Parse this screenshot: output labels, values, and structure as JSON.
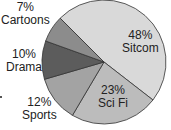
{
  "chart_data": {
    "type": "pie",
    "title": "",
    "categories": [
      "Sitcom",
      "Sci Fi",
      "Sports",
      "Drama",
      "Cartoons"
    ],
    "values": [
      48,
      23,
      12,
      10,
      7
    ],
    "unit": "%",
    "colors": [
      "#d9d9d9",
      "#bcbcbc",
      "#a3a3a3",
      "#5c5c5c",
      "#8c8c8c"
    ],
    "labels": [
      {
        "pct": "48%",
        "name": "Sitcom"
      },
      {
        "pct": "23%",
        "name": "Sci Fi"
      },
      {
        "pct": "12%",
        "name": "Sports"
      },
      {
        "pct": "10%",
        "name": "Drama"
      },
      {
        "pct": "7%",
        "name": "Cartoons"
      }
    ],
    "legend": "none (labels placed on/next to slices)"
  }
}
